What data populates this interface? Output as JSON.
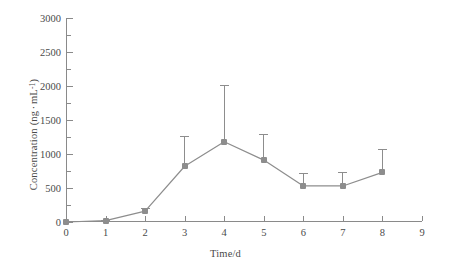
{
  "chart_data": {
    "type": "line",
    "title": "",
    "subtitle": "",
    "xlabel": "Time/d",
    "ylabel": "Concentration (ng · mL⁻¹)",
    "ylabel_parts": {
      "prefix": "Concentration (ng",
      "middot": "·",
      "unit": "mL",
      "exponent": "-1",
      "suffix": ")"
    },
    "x": [
      0,
      1,
      2,
      3,
      4,
      5,
      6,
      7,
      8
    ],
    "values": [
      0,
      20,
      160,
      820,
      1180,
      910,
      530,
      530,
      730
    ],
    "error_upper": [
      0,
      10,
      50,
      450,
      840,
      390,
      190,
      200,
      350
    ],
    "error_direction": "upper-only",
    "xlim": [
      0,
      9
    ],
    "ylim": [
      0,
      3000
    ],
    "xticks": [
      0,
      1,
      2,
      3,
      4,
      5,
      6,
      7,
      8,
      9
    ],
    "xticklabels": [
      "0",
      "1",
      "2",
      "3",
      "4",
      "5",
      "6",
      "7",
      "8",
      "9"
    ],
    "yticks": [
      0,
      500,
      1000,
      1500,
      2000,
      2500,
      3000
    ],
    "yticklabels": [
      "0",
      "500",
      "1000",
      "1500",
      "2000",
      "2500",
      "3000"
    ],
    "yminorticks": [
      250,
      750,
      1250,
      1750,
      2250,
      2750
    ],
    "grid": false,
    "legend": null,
    "legend_position": "none",
    "series": [
      {
        "name": "Concentration",
        "marker": "square",
        "color": "#8d8d8d",
        "line_color": "#8d8d8d",
        "values": [
          0,
          20,
          160,
          820,
          1180,
          910,
          530,
          530,
          730
        ]
      }
    ],
    "annotations": []
  },
  "colors": {
    "series": "#8d8d8d",
    "axis": "#8a8a8a",
    "text": "#4a4a4a",
    "background": "#ffffff"
  }
}
